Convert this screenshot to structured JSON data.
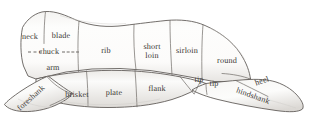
{
  "figure": {
    "background_color": "#ffffff",
    "outline_color": "#5a5551",
    "division_line_color": "#6e6a66",
    "label_color": "#3a3632",
    "fill_color": "#fdfdfc",
    "shade_color": "#dedcd9"
  },
  "cuts": [
    {
      "id": "neck",
      "label": "neck",
      "x": 30,
      "y": 37,
      "rotation": 0,
      "lines": 1
    },
    {
      "id": "blade",
      "label": "blade",
      "x": 61,
      "y": 36,
      "rotation": 0,
      "lines": 1
    },
    {
      "id": "chuck",
      "label": "chuck",
      "x": 49,
      "y": 52,
      "rotation": 0,
      "lines": 1
    },
    {
      "id": "arm",
      "label": "arm",
      "x": 53,
      "y": 68,
      "rotation": 0,
      "lines": 1
    },
    {
      "id": "rib",
      "label": "rib",
      "x": 106,
      "y": 51,
      "rotation": 0,
      "lines": 1
    },
    {
      "id": "short-loin",
      "label": "short\nloin",
      "x": 152,
      "y": 51,
      "rotation": 0,
      "lines": 2
    },
    {
      "id": "sirloin",
      "label": "sirloin",
      "x": 187,
      "y": 51,
      "rotation": 0,
      "lines": 1
    },
    {
      "id": "round",
      "label": "round",
      "x": 227,
      "y": 61,
      "rotation": 0,
      "lines": 1
    },
    {
      "id": "foreshank",
      "label": "foreshank",
      "x": 31,
      "y": 98,
      "rotation": -42,
      "lines": 1
    },
    {
      "id": "brisket",
      "label": "brisket",
      "x": 77,
      "y": 95,
      "rotation": 0,
      "lines": 1
    },
    {
      "id": "plate",
      "label": "plate",
      "x": 114,
      "y": 93,
      "rotation": 0,
      "lines": 1
    },
    {
      "id": "flank",
      "label": "flank",
      "x": 157,
      "y": 89,
      "rotation": 0,
      "lines": 1
    },
    {
      "id": "tip-upper",
      "label": "tip",
      "x": 199,
      "y": 80,
      "rotation": 0,
      "lines": 1
    },
    {
      "id": "tip-lower",
      "label": "tip",
      "x": 214,
      "y": 84,
      "rotation": 0,
      "lines": 1
    },
    {
      "id": "heel",
      "label": "heel",
      "x": 262,
      "y": 81,
      "rotation": -19,
      "lines": 1
    },
    {
      "id": "hindshank",
      "label": "hindshank",
      "x": 253,
      "y": 96,
      "rotation": 20,
      "lines": 1
    }
  ],
  "chuck_leaders": [
    {
      "id": "chuck-leader-left",
      "x": 28,
      "y": 52,
      "width": 14
    },
    {
      "id": "chuck-leader-right",
      "x": 62,
      "y": 52,
      "width": 17
    }
  ]
}
